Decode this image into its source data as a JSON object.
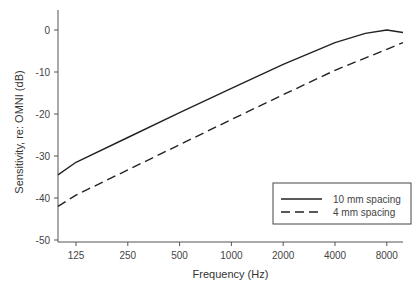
{
  "chart_data": {
    "type": "line",
    "title": "",
    "xlabel": "Frequency (Hz)",
    "ylabel": "Sensitivity, re: OMNI (dB)",
    "x_scale": "log2",
    "x_ticks": [
      125,
      250,
      500,
      1000,
      2000,
      4000,
      8000
    ],
    "x_tick_labels": [
      "125",
      "250",
      "500",
      "1000",
      "2000",
      "4000",
      "8000"
    ],
    "y_ticks": [
      0,
      -10,
      -20,
      -30,
      -40,
      -50
    ],
    "y_tick_labels": [
      "0",
      "-10",
      "-20",
      "-30",
      "-40",
      "-50"
    ],
    "ylim": [
      -50,
      4
    ],
    "xlim": [
      90,
      11000
    ],
    "grid": false,
    "legend_position": "lower right",
    "series": [
      {
        "name": "10 mm spacing",
        "style": "solid",
        "x": [
          90,
          125,
          250,
          500,
          1000,
          2000,
          4000,
          6000,
          8000,
          11000
        ],
        "y": [
          -34.5,
          -31.5,
          -25.6,
          -19.7,
          -13.9,
          -8.2,
          -3.0,
          -0.8,
          0,
          -0.6
        ]
      },
      {
        "name": "4 mm spacing",
        "style": "dashed",
        "x": [
          90,
          125,
          250,
          500,
          1000,
          2000,
          4000,
          8000,
          11000
        ],
        "y": [
          -42,
          -39.3,
          -33.3,
          -27.3,
          -21.3,
          -15.4,
          -9.6,
          -4.6,
          -3.0
        ]
      }
    ]
  },
  "legend": {
    "items": [
      "10 mm spacing",
      "4 mm spacing"
    ]
  }
}
